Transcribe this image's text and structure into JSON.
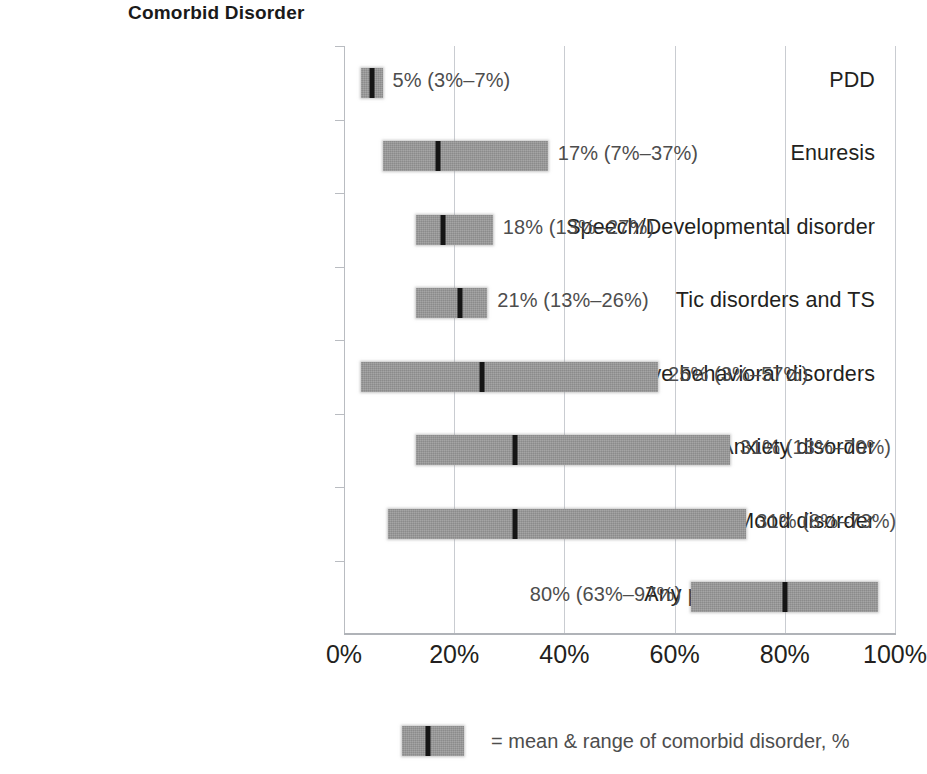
{
  "chart_title": "Comorbid Disorder",
  "legend": {
    "swatch_name": "mean-range-swatch",
    "text": "= mean & range of comorbid disorder, %"
  },
  "axis": {
    "x_tick_labels": [
      "0%",
      "20%",
      "40%",
      "60%",
      "80%",
      "100%"
    ]
  },
  "chart_data": {
    "type": "bar",
    "title": "Comorbid Disorder",
    "xlabel": "",
    "ylabel": "",
    "xlim": [
      0,
      100
    ],
    "grid": true,
    "legend_position": "bottom-center",
    "orientation": "horizontal",
    "value_unit": "%",
    "categories": [
      "PDD",
      "Enuresis",
      "Speech/Developmental disorder",
      "Tic disorders and TS",
      "Disruptive behavioral disorders",
      "Anxiety disorder",
      "Mood disorder",
      "Any psychiatric disorder"
    ],
    "means": [
      5,
      17,
      18,
      21,
      25,
      31,
      31,
      80
    ],
    "range_low": [
      3,
      7,
      13,
      13,
      3,
      13,
      8,
      63
    ],
    "range_high": [
      7,
      37,
      27,
      26,
      57,
      70,
      73,
      97
    ],
    "value_labels": [
      "5% (3%–7%)",
      "17% (7%–37%)",
      "18% (13%–27%)",
      "21% (13%–26%)",
      "25% (3%–57%)",
      "31% (13%–70%)",
      "31% (8%–73%)",
      "80% (63%–97%)"
    ],
    "label_side": [
      "right",
      "right",
      "right",
      "right",
      "right",
      "right",
      "right",
      "left"
    ],
    "x_tick_values": [
      0,
      20,
      40,
      60,
      80,
      100
    ],
    "x_tick_labels": [
      "0%",
      "20%",
      "40%",
      "60%",
      "80%",
      "100%"
    ],
    "bar_color": "#9b9b9b",
    "mean_marker_color": "#151515"
  }
}
